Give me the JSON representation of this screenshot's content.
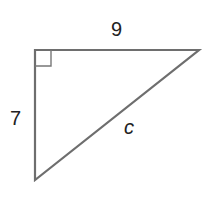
{
  "diagram": {
    "type": "right-triangle",
    "labels": {
      "top_side": "9",
      "left_side": "7",
      "hypotenuse": "c"
    },
    "stroke_color": "#6e6e6e",
    "vertices": {
      "top_left": [
        35,
        50
      ],
      "top_right": [
        199,
        50
      ],
      "bottom_left": [
        35,
        180
      ]
    },
    "right_angle_marker": "top_left"
  }
}
